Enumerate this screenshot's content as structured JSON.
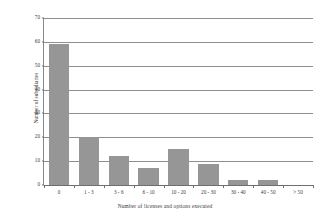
{
  "chart_data": {
    "type": "bar",
    "title": "",
    "xlabel": "Number of licenses and options executed",
    "ylabel": "Number of subsidiaries",
    "categories": [
      "0",
      "1 - 3",
      "3 - 6",
      "6 - 10",
      "10 - 20",
      "20 - 30",
      "30 - 40",
      "40 - 50",
      "> 50"
    ],
    "values": [
      59,
      20,
      12,
      7,
      15,
      9,
      2,
      2,
      0
    ],
    "ylim": [
      0,
      70
    ],
    "yticks": [
      0,
      10,
      20,
      30,
      40,
      50,
      60,
      70
    ],
    "ytick_labels": [
      "0",
      "10",
      "20",
      "30",
      "40",
      "50",
      "60",
      "70"
    ],
    "grid": true,
    "legend": false,
    "bar_color": "#969696",
    "grid_color": "#8d8d8d",
    "axis_color": "#6e6e6e",
    "text_color": "#3a3a3a"
  }
}
